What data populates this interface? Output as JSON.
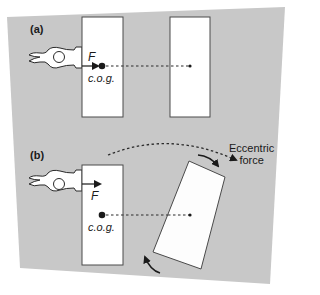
{
  "diagram": {
    "background_color": "#c8c8c8",
    "box_fill": "#ffffff",
    "stroke_color": "#2a2a2a",
    "panels": [
      {
        "id": "a",
        "label": "(a)",
        "force_label": "F",
        "cog_label": "c.o.g.",
        "description": "Push applied in line with centre of gravity: box translates straight"
      },
      {
        "id": "b",
        "label": "(b)",
        "force_label": "F",
        "cog_label": "c.o.g.",
        "annotation": "Eccentric force",
        "annotation_lines": [
          "Eccentric",
          "force"
        ],
        "description": "Push applied off-centre from centre of gravity: box rotates"
      }
    ]
  }
}
